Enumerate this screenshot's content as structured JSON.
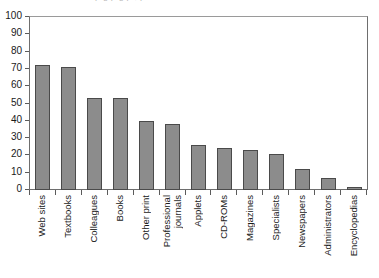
{
  "chart_data": {
    "type": "bar",
    "title": "",
    "clipped_title_fragment": "p g p g p ,  p",
    "xlabel": "",
    "ylabel": "",
    "ylim": [
      0,
      100
    ],
    "ytick_step": 10,
    "yticks": [
      100,
      90,
      80,
      70,
      60,
      50,
      40,
      30,
      20,
      10,
      0
    ],
    "grid": false,
    "legend": null,
    "bar_color": "#8c8c8c",
    "bar_edge_color": "#4a4a4a",
    "categories": [
      "Web sites",
      "Textbooks",
      "Colleagues",
      "Books",
      "Other print",
      "Professional journals",
      "Applets",
      "CD-ROMs",
      "Magazines",
      "Specialists",
      "Newspapers",
      "Administrators",
      "Encyclopedias"
    ],
    "category_lines": [
      [
        "Web sites"
      ],
      [
        "Textbooks"
      ],
      [
        "Colleagues"
      ],
      [
        "Books"
      ],
      [
        "Other print"
      ],
      [
        "Professional",
        "journals"
      ],
      [
        "Applets"
      ],
      [
        "CD-ROMs"
      ],
      [
        "Magazines"
      ],
      [
        "Specialists"
      ],
      [
        "Newspapers"
      ],
      [
        "Administrators"
      ],
      [
        "Encyclopedias"
      ]
    ],
    "values": [
      72,
      71,
      53,
      53,
      40,
      38,
      26,
      24,
      23,
      21,
      12,
      7,
      2
    ]
  }
}
